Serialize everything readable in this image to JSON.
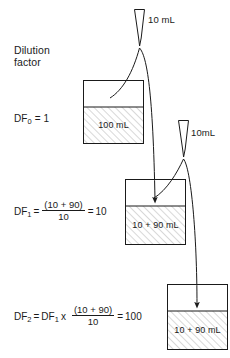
{
  "diagram": {
    "title_label": "Dilution\nfactor",
    "title_line1": "Dilution",
    "title_line2": "factor",
    "colors": {
      "stroke": "#1a1a1a",
      "hatch": "#9a9a9a",
      "background": "#ffffff",
      "text": "#1a1a1a"
    }
  },
  "rows": [
    {
      "id": "row-0",
      "df_prefix": "DF",
      "df_subscript": "0",
      "df_equals": "=",
      "df_value": "1",
      "df_full": "DF0 = 1",
      "has_fraction": false,
      "beaker": {
        "label": "100 mL",
        "x": 83,
        "y": 80,
        "width": 61,
        "height": 64,
        "liquid_y": 107
      }
    },
    {
      "id": "row-1",
      "df_prefix": "DF",
      "df_subscript": "1",
      "df_equals": "=",
      "df_numerator": "(10 + 90)",
      "df_denominator": "10",
      "df_result_equals": "=",
      "df_value": "10",
      "df_full": "DF1 = (10 + 90)/10 = 10",
      "has_fraction": true,
      "beaker": {
        "label": "10 + 90 mL",
        "x": 125,
        "y": 179,
        "width": 61,
        "height": 66,
        "liquid_y": 206
      }
    },
    {
      "id": "row-2",
      "df_prefix": "DF",
      "df_subscript": "2",
      "df_equals": "=",
      "df_multiplicand_prefix": "DF",
      "df_multiplicand_subscript": "1",
      "df_times": "x",
      "df_numerator": "(10 + 90)",
      "df_denominator": "10",
      "df_result_equals": "=",
      "df_value": "100",
      "df_full": "DF2 = DF1 x (10 + 90)/10 = 100",
      "has_fraction": true,
      "beaker": {
        "label": "10 + 90 mL",
        "x": 167,
        "y": 284,
        "width": 61,
        "height": 66,
        "liquid_y": 311
      }
    }
  ],
  "pipettes": [
    {
      "id": "pipette-1",
      "label": "10 mL",
      "x": 134,
      "y": 9,
      "width": 11,
      "height": 37,
      "label_x": 148,
      "label_y": 14
    },
    {
      "id": "pipette-2",
      "label": "10mL",
      "x": 178,
      "y": 120,
      "width": 11,
      "height": 37,
      "label_x": 191,
      "label_y": 127
    }
  ],
  "transfers": [
    {
      "id": "transfer-1",
      "from": "beaker-0",
      "to": "beaker-1",
      "description": "10 mL transferred from 100 mL beaker to second beaker"
    },
    {
      "id": "transfer-2",
      "from": "beaker-1",
      "to": "beaker-2",
      "description": "10 mL transferred from second beaker to third beaker"
    }
  ]
}
